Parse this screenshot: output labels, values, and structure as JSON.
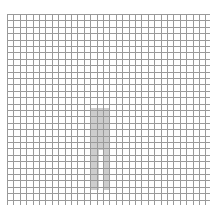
{
  "image": {
    "width": 219,
    "height": 221,
    "background": "#ffffff"
  },
  "grid": {
    "x0": 7,
    "y0": 14,
    "x1": 210,
    "y1": 205,
    "spacing": 6.4,
    "line_color": "#9a9a9a",
    "line_width": 1
  },
  "shape": {
    "fill": "#c4c4c4",
    "opacity": 0.85,
    "body": {
      "x": 91,
      "y": 108,
      "w": 19,
      "h": 82
    },
    "gap": {
      "x": 99,
      "y": 150,
      "w": 4,
      "h": 40
    }
  }
}
